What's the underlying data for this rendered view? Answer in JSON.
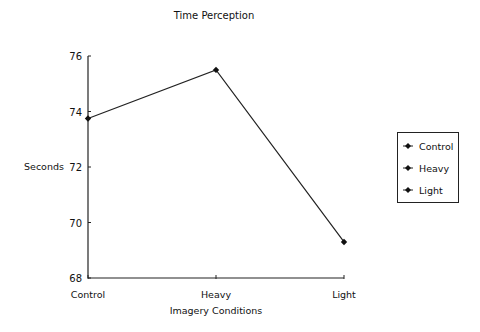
{
  "chart_data": {
    "type": "line",
    "title": "Time Perception",
    "xlabel": "Imagery Conditions",
    "ylabel": "Seconds",
    "categories": [
      "Control",
      "Heavy",
      "Light"
    ],
    "series": [
      {
        "name": "Time Perception",
        "values": [
          73.75,
          75.5,
          69.3
        ]
      }
    ],
    "yticks": [
      68,
      70,
      72,
      74,
      76
    ],
    "ylim": [
      68,
      76
    ],
    "grid": false,
    "legend": {
      "position": "right",
      "entries": [
        "Control",
        "Heavy",
        "Light"
      ]
    }
  }
}
